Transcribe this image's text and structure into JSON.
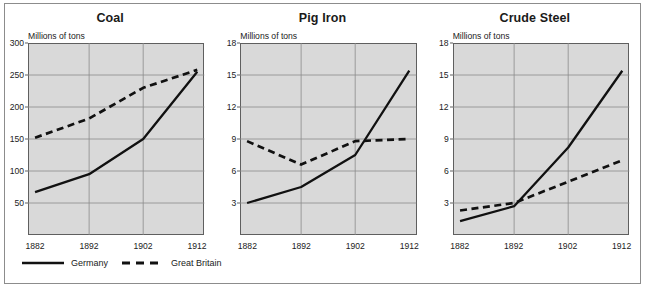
{
  "figure": {
    "legend": {
      "items": [
        {
          "label": "Germany",
          "style": "solid",
          "color": "#111111"
        },
        {
          "label": "Great Britain",
          "style": "dashed",
          "color": "#111111"
        }
      ]
    },
    "axis_unit_label": "Millions of tons",
    "colors": {
      "plot_background": "#d9d9d9",
      "gridline": "#8c8c8c",
      "axis": "#5f5f5f",
      "frame": "#8c8c8c",
      "series_line": "#111111",
      "text": "#1a1a1a"
    }
  },
  "chart_data": [
    {
      "type": "line",
      "title": "Coal",
      "xlabel": "",
      "ylabel": "Millions of tons",
      "x": [
        1882,
        1892,
        1902,
        1912
      ],
      "xticklabels": [
        "1882",
        "1892",
        "1902",
        "1912"
      ],
      "ylim": [
        0,
        300
      ],
      "yticks": [
        50,
        100,
        150,
        200,
        250,
        300
      ],
      "yticklabels": [
        "50",
        "100",
        "150",
        "200",
        "250",
        "300"
      ],
      "grid": true,
      "legend_position": "bottom",
      "series": [
        {
          "name": "Germany",
          "style": "solid",
          "values": [
            67,
            95,
            150,
            255
          ]
        },
        {
          "name": "Great Britain",
          "style": "dashed",
          "values": [
            152,
            182,
            230,
            258
          ]
        }
      ]
    },
    {
      "type": "line",
      "title": "Pig Iron",
      "xlabel": "",
      "ylabel": "Millions of tons",
      "x": [
        1882,
        1892,
        1902,
        1912
      ],
      "xticklabels": [
        "1882",
        "1892",
        "1902",
        "1912"
      ],
      "ylim": [
        0,
        18
      ],
      "yticks": [
        3,
        6,
        9,
        12,
        15,
        18
      ],
      "yticklabels": [
        "3",
        "6",
        "9",
        "12",
        "15",
        "18"
      ],
      "grid": true,
      "legend_position": "bottom",
      "series": [
        {
          "name": "Germany",
          "style": "solid",
          "values": [
            3.0,
            4.5,
            7.5,
            15.4
          ]
        },
        {
          "name": "Great Britain",
          "style": "dashed",
          "values": [
            8.8,
            6.6,
            8.8,
            9.0
          ]
        }
      ]
    },
    {
      "type": "line",
      "title": "Crude Steel",
      "xlabel": "",
      "ylabel": "Millions of tons",
      "x": [
        1882,
        1892,
        1902,
        1912
      ],
      "xticklabels": [
        "1882",
        "1892",
        "1902",
        "1912"
      ],
      "ylim": [
        0,
        18
      ],
      "yticks": [
        3,
        6,
        9,
        12,
        15,
        18
      ],
      "yticklabels": [
        "3",
        "6",
        "9",
        "12",
        "15",
        "18"
      ],
      "grid": true,
      "legend_position": "bottom",
      "series": [
        {
          "name": "Germany",
          "style": "solid",
          "values": [
            1.3,
            2.7,
            8.2,
            15.4
          ]
        },
        {
          "name": "Great Britain",
          "style": "dashed",
          "values": [
            2.3,
            3.0,
            5.0,
            7.0
          ]
        }
      ]
    }
  ]
}
